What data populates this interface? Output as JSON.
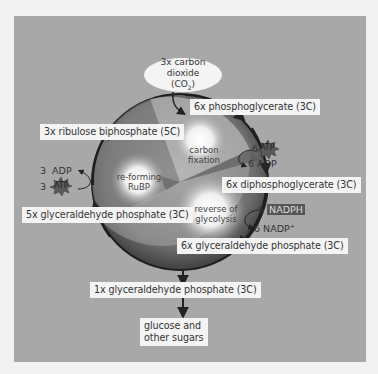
{
  "colors": {
    "page_background": "#f2f2f2",
    "panel_background": "#a8a8a8",
    "label_background": "#f4f4f4",
    "circle_dark": "#3a3a3a",
    "circle_light": "#f2f2f2",
    "atp_star": "#5a5a5a",
    "nadph_box": "#555555",
    "arrow": "#222222"
  },
  "input": {
    "line1": "3x carbon dioxide",
    "line2": "(CO",
    "line2_sub": "2",
    "line2_end": ")"
  },
  "cycle_stages": [
    {
      "id": "carbon_fixation",
      "line1": "carbon",
      "line2": "fixation"
    },
    {
      "id": "reforming_rubp",
      "line1": "re-forming",
      "line2": "RuBP"
    },
    {
      "id": "reverse_glycolysis",
      "line1": "reverse of",
      "line2": "glycolysis"
    }
  ],
  "compounds": {
    "phosphoglycerate": "6x phosphoglycerate (3C)",
    "ribulose_biphosphate": "3x ribulose biphosphate (5C)",
    "diphosphoglycerate": "6x diphosphoglycerate (3C)",
    "g3p_5x": "5x glyceraldehyde phosphate (3C)",
    "g3p_6x": "6x glyceraldehyde phosphate (3C)",
    "g3p_1x": "1x glyceraldehyde phosphate (3C)"
  },
  "cofactors": {
    "right_atp_count": "6",
    "right_atp": "ATP",
    "right_adp_count": "6",
    "right_adp": "ADP",
    "right_nadph_count": "6",
    "right_nadph": "NADPH",
    "right_nadp_count": "6",
    "right_nadp": "NADP",
    "right_nadp_sup": "+",
    "left_adp_count": "3",
    "left_adp": "ADP",
    "left_atp_count": "3",
    "left_atp": "ATP"
  },
  "output": {
    "line1": "glucose and",
    "line2": "other sugars"
  }
}
